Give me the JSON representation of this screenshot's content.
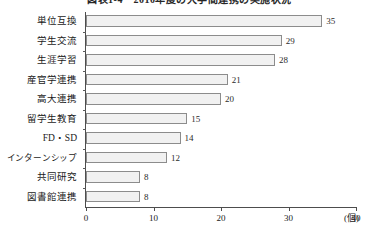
{
  "chart_data": {
    "type": "bar",
    "orientation": "horizontal",
    "title": "図表1-4　2010年度の大学間連携の実施状況",
    "xlabel": "",
    "ylabel": "",
    "unit_label": "(個)",
    "xlim": [
      0,
      40
    ],
    "xticks": [
      0,
      10,
      20,
      30,
      40
    ],
    "xtick_labels": [
      "0",
      "10",
      "20",
      "30",
      "40"
    ],
    "grid": false,
    "legend": false,
    "categories": [
      "単位互換",
      "学生交流",
      "生涯学習",
      "産官学連携",
      "高大連携",
      "留学生教育",
      "FD・SD",
      "インターンシップ",
      "共同研究",
      "図書館連携"
    ],
    "values": [
      35,
      29,
      28,
      21,
      20,
      15,
      14,
      12,
      8,
      8
    ],
    "value_labels": [
      "35",
      "29",
      "28",
      "21",
      "20",
      "15",
      "14",
      "12",
      "8",
      "8"
    ],
    "colors": {
      "bar_fill": "#f1f1f1",
      "bar_border": "#8c8c8c",
      "axis": "#4d4d4d",
      "text": "#1a1a1a"
    }
  }
}
